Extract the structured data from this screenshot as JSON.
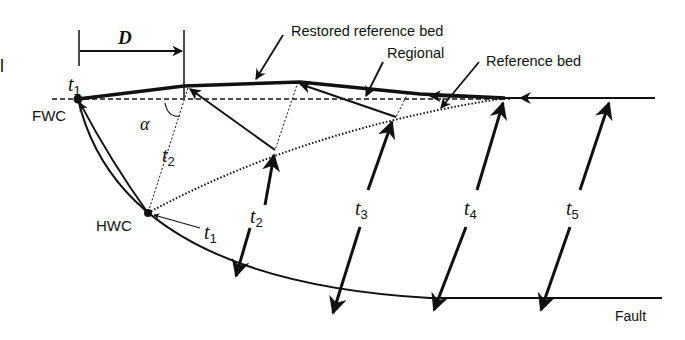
{
  "labels": {
    "D": "D",
    "alpha": "α",
    "fwc": "FWC",
    "hwc": "HWC",
    "fault": "Fault",
    "restored": "Restored reference bed",
    "regional": "Regional",
    "reference": "Reference bed",
    "edge_fragment": "l"
  },
  "thickness": [
    {
      "t": "t",
      "sub": "1",
      "name": "t1-top"
    },
    {
      "t": "t",
      "sub": "2",
      "name": "t2-left"
    },
    {
      "t": "t",
      "sub": "1",
      "name": "t1-hwc"
    },
    {
      "t": "t",
      "sub": "2",
      "name": "t2"
    },
    {
      "t": "t",
      "sub": "3",
      "name": "t3"
    },
    {
      "t": "t",
      "sub": "4",
      "name": "t4"
    },
    {
      "t": "t",
      "sub": "5",
      "name": "t5"
    }
  ],
  "colors": {
    "ink": "#111111",
    "bg": "#ffffff"
  }
}
